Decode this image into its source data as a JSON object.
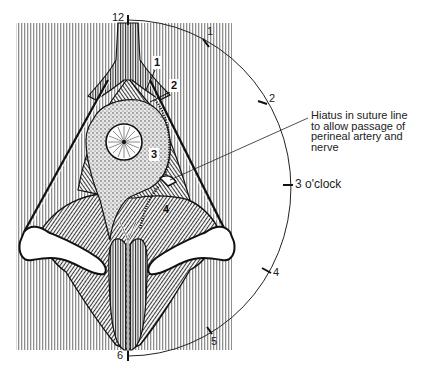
{
  "figure": {
    "type": "anatomical-illustration",
    "clock_face": {
      "ticks": [
        {
          "label": "12",
          "position": "top"
        },
        {
          "label": "1",
          "position": "upper-right"
        },
        {
          "label": "2",
          "position": "right-upper"
        },
        {
          "label": "3 o'clock",
          "position": "right"
        },
        {
          "label": "4",
          "position": "right-lower"
        },
        {
          "label": "5",
          "position": "lower-right"
        },
        {
          "label": "6",
          "position": "bottom"
        }
      ]
    },
    "numbered_labels": [
      {
        "label": "1"
      },
      {
        "label": "2"
      },
      {
        "label": "3"
      },
      {
        "label": "4"
      }
    ],
    "annotation": {
      "lines": [
        "Hiatus in suture line",
        "to allow passage of",
        "perineal artery and",
        "nerve"
      ]
    },
    "colors": {
      "ink": "#1a1a1a",
      "stripe": "#9a9a9a",
      "background": "#ffffff"
    }
  }
}
